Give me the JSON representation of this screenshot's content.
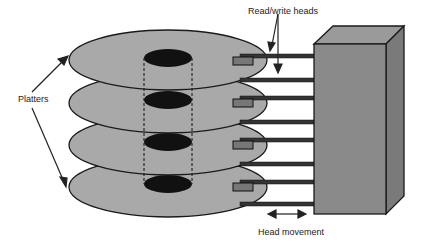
{
  "diagram": {
    "labels": {
      "platters": "Platters",
      "read_write_heads": "Read/write heads",
      "head_movement": "Head movement"
    },
    "platters": [
      {
        "cy": 60
      },
      {
        "cy": 103
      },
      {
        "cy": 145
      },
      {
        "cy": 187
      }
    ],
    "colors": {
      "platter_fill": "#a9a9a9",
      "spindle_hole": "#111111",
      "actuator_front": "#8a8a8a",
      "actuator_top": "#9a9a9a",
      "actuator_side": "#7a7a7a",
      "arm": "#333333",
      "head": "#777777",
      "outline": "#1a1a1a"
    }
  }
}
